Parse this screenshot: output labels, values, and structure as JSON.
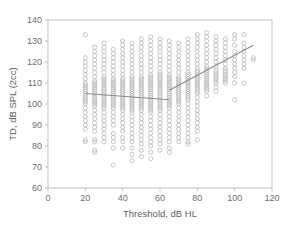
{
  "chart_data": {
    "type": "scatter",
    "title": "",
    "xlabel": "Threshold, dB HL",
    "ylabel": "TD, dB SPL (2cc)",
    "xlim": [
      0,
      120
    ],
    "ylim": [
      60,
      140
    ],
    "xticks": [
      0,
      20,
      40,
      60,
      80,
      100,
      120
    ],
    "yticks": [
      60,
      70,
      80,
      90,
      100,
      110,
      120,
      130,
      140
    ],
    "grid": false,
    "legend": null,
    "marker_style": "open-circle",
    "marker_color": "#b4b4b4",
    "trend_color": "#8a8a8a",
    "frame_color": "#b9b9b9",
    "background": "#ffffff",
    "series": [
      {
        "name": "TD vs Threshold",
        "note": "Columns of repeated measurements at 5 dB threshold steps",
        "columns": [
          {
            "x": 20,
            "y": [
              133,
              122,
              120,
              118,
              116,
              114,
              112,
              110,
              109,
              108,
              107,
              106,
              105,
              104,
              103,
              102,
              101,
              100,
              98,
              96,
              94,
              92,
              90,
              88,
              83,
              82
            ]
          },
          {
            "x": 25,
            "y": [
              127,
              125,
              123,
              121,
              119,
              117,
              115,
              113,
              111,
              110,
              109,
              108,
              107,
              106,
              105,
              104,
              103,
              102,
              101,
              100,
              99,
              97,
              95,
              93,
              91,
              89,
              87,
              83,
              82,
              78,
              77
            ]
          },
          {
            "x": 30,
            "y": [
              129,
              127,
              125,
              123,
              121,
              119,
              117,
              115,
              113,
              112,
              111,
              110,
              109,
              108,
              107,
              106,
              105,
              104,
              103,
              102,
              101,
              100,
              99,
              98,
              96,
              94,
              92,
              90,
              88,
              86,
              84,
              82
            ]
          },
          {
            "x": 35,
            "y": [
              126,
              124,
              122,
              120,
              118,
              116,
              114,
              112,
              111,
              110,
              109,
              108,
              107,
              106,
              105,
              104,
              103,
              102,
              101,
              100,
              99,
              98,
              96,
              94,
              92,
              90,
              86,
              84,
              82,
              79,
              71
            ]
          },
          {
            "x": 40,
            "y": [
              130,
              128,
              126,
              124,
              122,
              120,
              118,
              116,
              114,
              112,
              111,
              110,
              109,
              108,
              107,
              106,
              105,
              104,
              103,
              102,
              101,
              100,
              99,
              98,
              97,
              95,
              93,
              91,
              89,
              87,
              84,
              82,
              79
            ]
          },
          {
            "x": 45,
            "y": [
              129,
              127,
              125,
              123,
              121,
              119,
              117,
              115,
              113,
              112,
              111,
              110,
              109,
              108,
              107,
              106,
              105,
              104,
              103,
              102,
              101,
              100,
              99,
              98,
              97,
              96,
              94,
              92,
              90,
              88,
              86,
              84,
              82,
              79,
              76,
              73
            ]
          },
          {
            "x": 50,
            "y": [
              131,
              129,
              127,
              125,
              123,
              121,
              119,
              117,
              115,
              113,
              112,
              111,
              110,
              109,
              108,
              107,
              106,
              105,
              104,
              103,
              102,
              101,
              100,
              99,
              98,
              97,
              95,
              93,
              91,
              89,
              87,
              85,
              83,
              81,
              78,
              75
            ]
          },
          {
            "x": 55,
            "y": [
              132,
              130,
              128,
              126,
              124,
              122,
              120,
              118,
              116,
              114,
              113,
              112,
              111,
              110,
              109,
              108,
              107,
              106,
              105,
              104,
              103,
              102,
              101,
              100,
              99,
              98,
              97,
              96,
              94,
              92,
              90,
              88,
              86,
              84,
              82,
              80,
              77,
              74
            ]
          },
          {
            "x": 60,
            "y": [
              131,
              129,
              127,
              125,
              123,
              121,
              119,
              117,
              115,
              114,
              113,
              112,
              111,
              110,
              109,
              108,
              107,
              106,
              105,
              104,
              103,
              102,
              101,
              100,
              99,
              98,
              97,
              95,
              93,
              91,
              89,
              87,
              85,
              83,
              81,
              78
            ]
          },
          {
            "x": 65,
            "y": [
              130,
              128,
              126,
              124,
              122,
              120,
              118,
              116,
              114,
              113,
              112,
              111,
              110,
              109,
              108,
              107,
              106,
              105,
              104,
              103,
              102,
              101,
              100,
              99,
              98,
              96,
              94,
              92,
              90,
              88,
              86,
              84,
              82,
              79,
              77
            ]
          },
          {
            "x": 70,
            "y": [
              129,
              127,
              125,
              123,
              121,
              119,
              117,
              115,
              113,
              112,
              111,
              110,
              109,
              108,
              107,
              106,
              105,
              104,
              103,
              102,
              101,
              100,
              98,
              96,
              94,
              92,
              90,
              88,
              86,
              84,
              82
            ]
          },
          {
            "x": 75,
            "y": [
              131,
              129,
              127,
              125,
              123,
              121,
              119,
              117,
              115,
              114,
              113,
              112,
              111,
              110,
              109,
              108,
              107,
              106,
              105,
              104,
              103,
              102,
              100,
              98,
              96,
              94,
              92,
              90,
              88,
              86,
              84,
              82,
              81
            ]
          },
          {
            "x": 80,
            "y": [
              133,
              131,
              129,
              127,
              125,
              123,
              121,
              119,
              117,
              116,
              115,
              114,
              113,
              112,
              111,
              110,
              109,
              108,
              107,
              106,
              105,
              103,
              101,
              99,
              97,
              95,
              93,
              91,
              89,
              87,
              83
            ]
          },
          {
            "x": 85,
            "y": [
              134,
              132,
              130,
              128,
              126,
              124,
              122,
              120,
              118,
              117,
              116,
              115,
              114,
              113,
              112,
              111,
              110,
              109,
              108,
              107,
              106,
              104
            ]
          },
          {
            "x": 90,
            "y": [
              132,
              130,
              128,
              126,
              124,
              122,
              120,
              118,
              116,
              115,
              114,
              113,
              112,
              111,
              110,
              108,
              106
            ]
          },
          {
            "x": 95,
            "y": [
              131,
              129,
              127,
              125,
              123,
              121,
              119,
              117,
              116,
              115,
              114,
              113,
              112,
              111,
              110
            ]
          },
          {
            "x": 100,
            "y": [
              133,
              131,
              128,
              125,
              123,
              121,
              119,
              117,
              115,
              113,
              110,
              102
            ]
          },
          {
            "x": 105,
            "y": [
              133,
              129,
              127,
              125,
              123,
              121,
              119,
              117,
              110
            ]
          },
          {
            "x": 110,
            "y": [
              122,
              121
            ]
          }
        ]
      }
    ],
    "trend_lines": [
      {
        "name": "low-threshold-fit",
        "x1": 20,
        "y1": 105,
        "x2": 65,
        "y2": 102
      },
      {
        "name": "high-threshold-fit",
        "x1": 65,
        "y1": 106.5,
        "x2": 110,
        "y2": 128
      }
    ]
  }
}
